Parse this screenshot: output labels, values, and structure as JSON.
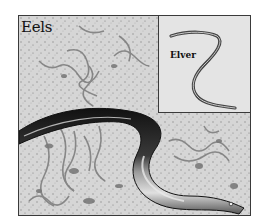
{
  "illustration": {
    "title": "Eels",
    "inset": {
      "label": "Elver"
    },
    "subjects": [
      "adult-eel",
      "elvers",
      "seabed"
    ],
    "colors": {
      "frame_border": "#3a3a3a",
      "seabed": "#d9d9d9",
      "inset_bg": "#e4e4e4",
      "eel_dark": "#1e1e1e",
      "eel_light": "#bdbdbd"
    }
  }
}
